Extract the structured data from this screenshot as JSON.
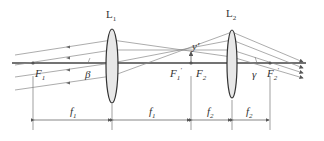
{
  "diagram": {
    "type": "two-lens optical system (telescope)",
    "lenses": [
      {
        "label": "L",
        "sub": "1",
        "x": 112
      },
      {
        "label": "L",
        "sub": "2",
        "x": 232
      }
    ],
    "points": {
      "F1": {
        "label": "F",
        "sub": "1"
      },
      "F1p": {
        "label": "F",
        "sub": "1",
        "prime": "′"
      },
      "F2": {
        "label": "F",
        "sub": "2"
      },
      "F2p": {
        "label": "F",
        "sub": "2",
        "prime": "′"
      }
    },
    "angles": {
      "beta": "β",
      "gamma": "γ"
    },
    "image_label": "y′",
    "dimensions": [
      {
        "label": "f",
        "sub": "1"
      },
      {
        "label": "f",
        "sub": "1"
      },
      {
        "label": "f",
        "sub": "2"
      },
      {
        "label": "f",
        "sub": "2"
      }
    ]
  }
}
